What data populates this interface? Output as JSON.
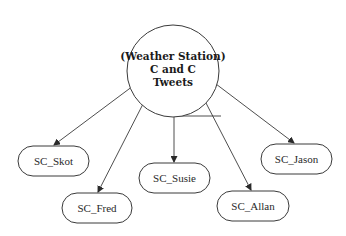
{
  "center": {
    "line1": "(Weather Station)",
    "line2": "C and C",
    "line3": "Tweets",
    "cx": 173,
    "cy": 71,
    "r": 46
  },
  "nodes": [
    {
      "label": "SC_Skot",
      "x": 18,
      "y": 146,
      "w": 71,
      "h": 30
    },
    {
      "label": "SC_Fred",
      "x": 62,
      "y": 193,
      "w": 70,
      "h": 30
    },
    {
      "label": "SC_Susie",
      "x": 139,
      "y": 163,
      "w": 71,
      "h": 30
    },
    {
      "label": "SC_Allan",
      "x": 217,
      "y": 191,
      "w": 72,
      "h": 30
    },
    {
      "label": "SC_Jason",
      "x": 261,
      "y": 144,
      "w": 71,
      "h": 30
    }
  ],
  "colors": {
    "stroke": "#3a3a3a",
    "background": "#ffffff"
  }
}
